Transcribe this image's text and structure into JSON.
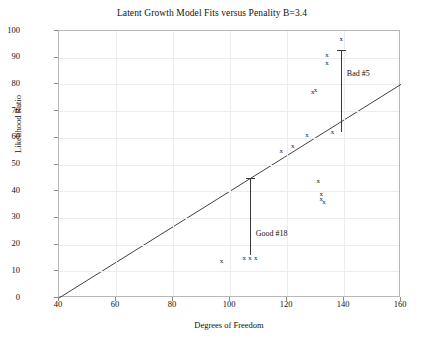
{
  "chart_data": {
    "type": "scatter",
    "title": "Latent Growth Model Fits versus Penality B=3.4",
    "xlabel": "Degrees of Freedom",
    "ylabel": "Likelihood Ratio",
    "xlim": [
      40,
      160
    ],
    "ylim": [
      0,
      100
    ],
    "xticks": [
      40,
      60,
      80,
      100,
      120,
      140,
      160
    ],
    "yticks": [
      0,
      10,
      20,
      30,
      40,
      50,
      60,
      70,
      80,
      90,
      100
    ],
    "grid": true,
    "legend": "none",
    "marker": "x",
    "points": [
      {
        "x": 97,
        "y": 14
      },
      {
        "x": 105,
        "y": 15
      },
      {
        "x": 107,
        "y": 15
      },
      {
        "x": 109,
        "y": 15
      },
      {
        "x": 118,
        "y": 55
      },
      {
        "x": 122,
        "y": 57
      },
      {
        "x": 127,
        "y": 61
      },
      {
        "x": 129,
        "y": 77
      },
      {
        "x": 130,
        "y": 78
      },
      {
        "x": 131,
        "y": 44
      },
      {
        "x": 132,
        "y": 39
      },
      {
        "x": 132,
        "y": 37
      },
      {
        "x": 133,
        "y": 36
      },
      {
        "x": 134,
        "y": 88
      },
      {
        "x": 134,
        "y": 91
      },
      {
        "x": 136,
        "y": 62
      },
      {
        "x": 139,
        "y": 97
      }
    ],
    "fit_line": {
      "label": "fit",
      "x_start": 40,
      "y_start": 0,
      "x_end": 160,
      "y_end": 80
    },
    "annotations": [
      {
        "label": "Bad #5",
        "type": "residual-bar",
        "x": 139,
        "y_bottom": 62,
        "y_top": 93,
        "label_x": 141,
        "label_y": 84
      },
      {
        "label": "Good #18",
        "type": "residual-bar",
        "x": 107,
        "y_bottom": 16,
        "y_top": 45,
        "label_x": 109,
        "label_y": 24
      }
    ]
  }
}
